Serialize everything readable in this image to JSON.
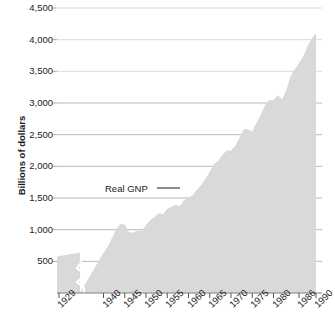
{
  "chart_data": {
    "type": "area",
    "title": "",
    "subtitle": "",
    "xlabel": "",
    "ylabel": "Billions of dollars",
    "series_label": "Real GNP",
    "legend_position": "inline-annotation",
    "grid": true,
    "xlim": [
      1929,
      1990
    ],
    "ylim": [
      0,
      4500
    ],
    "y_ticks": [
      500,
      1000,
      1500,
      2000,
      2500,
      3000,
      3500,
      4000,
      4500
    ],
    "y_tick_labels": [
      "500",
      "1,000",
      "1,500",
      "2,000",
      "2,500",
      "3,000",
      "3,500",
      "4,000",
      "4,500"
    ],
    "x_ticks": [
      1929,
      1940,
      1945,
      1950,
      1955,
      1960,
      1965,
      1970,
      1975,
      1980,
      1986,
      1990
    ],
    "x_tick_labels": [
      "1929",
      "1940",
      "1945",
      "1950",
      "1955",
      "1960",
      "1965",
      "1970",
      "1975",
      "1980",
      "1986",
      "1990"
    ],
    "axis_break_after": 1929,
    "fill_color": "#d9d9d9",
    "grid_color": "#a6a6a6",
    "axis_color": "#808080",
    "text_color": "#222222",
    "x": [
      1929,
      1933,
      1936,
      1939,
      1940,
      1941,
      1942,
      1943,
      1944,
      1945,
      1946,
      1947,
      1948,
      1949,
      1950,
      1951,
      1952,
      1953,
      1954,
      1955,
      1956,
      1957,
      1958,
      1959,
      1960,
      1961,
      1962,
      1963,
      1964,
      1965,
      1966,
      1967,
      1968,
      1969,
      1970,
      1971,
      1972,
      1973,
      1974,
      1975,
      1976,
      1977,
      1978,
      1979,
      1980,
      1981,
      1982,
      1983,
      1984,
      1985,
      1986,
      1987,
      1988,
      1989,
      1990
    ],
    "y": [
      710,
      500,
      640,
      720,
      780,
      905,
      1070,
      1250,
      1340,
      1330,
      1180,
      1170,
      1215,
      1210,
      1320,
      1420,
      1480,
      1550,
      1530,
      1640,
      1675,
      1710,
      1690,
      1810,
      1850,
      1900,
      2010,
      2100,
      2220,
      2360,
      2510,
      2570,
      2690,
      2770,
      2770,
      2860,
      3020,
      3190,
      3180,
      3140,
      3310,
      3460,
      3650,
      3760,
      3750,
      3840,
      3770,
      3940,
      4210,
      4350,
      4470,
      4600,
      4800,
      4950,
      5050
    ],
    "y_display_peak": 4100
  },
  "annotations": {
    "series_callout": "Real GNP"
  }
}
